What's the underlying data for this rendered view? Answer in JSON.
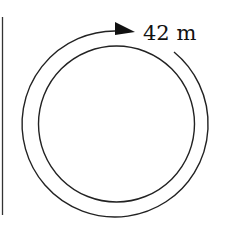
{
  "diagram": {
    "type": "circular-track",
    "label": "42 m",
    "colors": {
      "stroke": "#222222",
      "background": "#ffffff"
    },
    "outer_circle": {
      "cx": 116.5,
      "cy": 124,
      "r": 93
    },
    "inner_circle": {
      "cx": 116.5,
      "cy": 124,
      "r": 78
    },
    "arrow_direction": "clockwise"
  }
}
